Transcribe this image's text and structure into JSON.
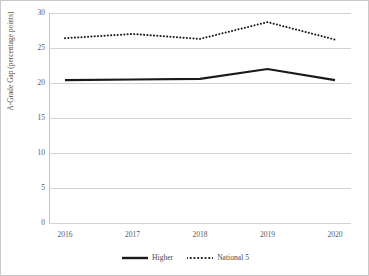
{
  "chart_data": {
    "type": "line",
    "title": "",
    "xlabel": "",
    "ylabel": "A-Grade Gap (percentage points)",
    "categories": [
      "2016",
      "2017",
      "2018",
      "2019",
      "2020"
    ],
    "x": [
      2016,
      2017,
      2018,
      2019,
      2020
    ],
    "ylim": [
      0,
      30
    ],
    "yticks": [
      0,
      5,
      10,
      15,
      20,
      25,
      30
    ],
    "ytick_labels": [
      "0",
      "5",
      "10",
      "15",
      "20",
      "25",
      "30"
    ],
    "grid": true,
    "legend_position": "bottom-center",
    "series": [
      {
        "name": "Higher",
        "style": "solid",
        "color": "#1a1a1a",
        "values": [
          20.4,
          20.5,
          20.6,
          22.0,
          20.4
        ]
      },
      {
        "name": "National 5",
        "style": "dotted",
        "color": "#1a1a1a",
        "values": [
          26.4,
          27.0,
          26.3,
          28.7,
          26.2
        ]
      }
    ]
  },
  "axis": {
    "y_title": "A-Grade Gap (percentage points)"
  },
  "legend": {
    "items": [
      {
        "label": "Higher",
        "style": "solid"
      },
      {
        "label": "National 5",
        "style": "dotted"
      }
    ]
  }
}
